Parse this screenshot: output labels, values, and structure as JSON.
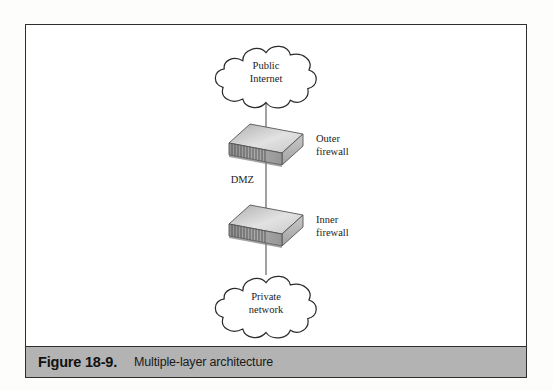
{
  "figure": {
    "caption_number": "Figure 18-9.",
    "caption_title": "Multiple-layer architecture"
  },
  "diagram": {
    "type": "network-architecture",
    "nodes": [
      {
        "id": "public-internet",
        "shape": "cloud",
        "label_line1": "Public",
        "label_line2": "Internet"
      },
      {
        "id": "outer-firewall",
        "shape": "device-box",
        "side_label_line1": "Outer",
        "side_label_line2": "firewall"
      },
      {
        "id": "inner-firewall",
        "shape": "device-box",
        "side_label_line1": "Inner",
        "side_label_line2": "firewall"
      },
      {
        "id": "private-network",
        "shape": "cloud",
        "label_line1": "Private",
        "label_line2": "network"
      }
    ],
    "links": [
      {
        "from": "public-internet",
        "to": "outer-firewall",
        "label": ""
      },
      {
        "from": "outer-firewall",
        "to": "inner-firewall",
        "label": "DMZ"
      },
      {
        "from": "inner-firewall",
        "to": "private-network",
        "label": ""
      }
    ],
    "zone_label": "DMZ"
  },
  "colors": {
    "frame_border": "#2e2e2e",
    "caption_bar": "#b3b3b3",
    "line": "#555555",
    "device_top": "#d8d8d8",
    "device_front": "#9a9a9a",
    "device_side": "#b8b8b8",
    "text": "#1c1c1c"
  }
}
